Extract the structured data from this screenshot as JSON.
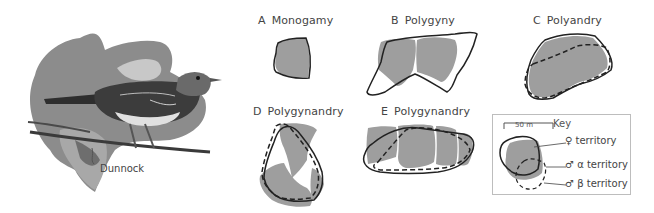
{
  "figure": {
    "bird_label": "Dunnock",
    "panels": [
      {
        "letter": "A",
        "title": "Monogamy"
      },
      {
        "letter": "B",
        "title": "Polygyny"
      },
      {
        "letter": "C",
        "title": "Polyandry"
      },
      {
        "letter": "D",
        "title": "Polygynandry"
      },
      {
        "letter": "E",
        "title": "Polygynandry"
      }
    ],
    "key": {
      "title": "Key",
      "scale_label": "50 m",
      "items": [
        {
          "symbol": "♀",
          "label": "territory",
          "style": "grey-fill"
        },
        {
          "symbol": "♂ α",
          "label": "territory",
          "style": "solid-outline"
        },
        {
          "symbol": "♂ β",
          "label": "territory",
          "style": "dashed-outline"
        }
      ]
    },
    "colors": {
      "female_fill": "#9e9e9e",
      "male_outline": "#222222",
      "background": "#ffffff"
    }
  }
}
